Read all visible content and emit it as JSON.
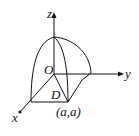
{
  "diagram": {
    "type": "3d-coordinate-sketch",
    "axes": {
      "x_label": "x",
      "y_label": "y",
      "z_label": "z"
    },
    "origin_label": "O",
    "region_label": "D",
    "point_label": "(a,a)",
    "colors": {
      "stroke": "#111111",
      "background": "#ffffff"
    }
  }
}
